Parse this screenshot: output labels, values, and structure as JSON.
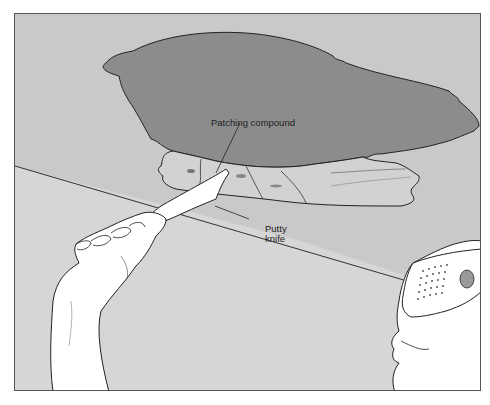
{
  "illustration": {
    "subject": "Applying patching compound to a ceiling hole with a putty knife",
    "labels": {
      "patching_compound": "Patching compound",
      "putty_knife": "Putty knife"
    },
    "colors": {
      "ceiling": "#c9c9c9",
      "hole": "#8c8c8c",
      "wall": "#d6d6d6",
      "patch": "#d2d2d2",
      "line": "#222222",
      "skin": "#ffffff",
      "frame_border": "#555555"
    }
  }
}
